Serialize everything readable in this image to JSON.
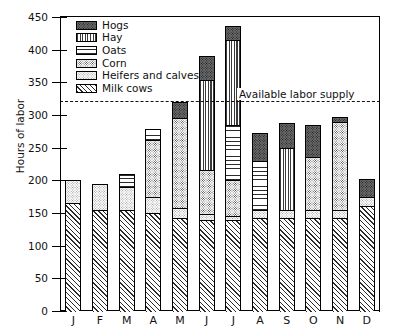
{
  "chart_data": {
    "type": "bar",
    "stacked": true,
    "title": "",
    "xlabel": "",
    "ylabel": "Hours of labor",
    "ylim": [
      0,
      450
    ],
    "ytick_step": 50,
    "yticks": [
      0,
      50,
      100,
      150,
      200,
      250,
      300,
      350,
      400,
      450
    ],
    "grid": false,
    "legend_position": "top-left",
    "categories": [
      "J",
      "F",
      "M",
      "A",
      "M",
      "J",
      "J",
      "A",
      "S",
      "O",
      "N",
      "D"
    ],
    "category_names": [
      "January",
      "February",
      "March",
      "April",
      "May",
      "June",
      "July",
      "August",
      "September",
      "October",
      "November",
      "December"
    ],
    "series": [
      {
        "name": "Milk cows",
        "values": [
          165,
          155,
          155,
          150,
          143,
          140,
          140,
          143,
          143,
          143,
          143,
          160
        ]
      },
      {
        "name": "Heifers and calves",
        "values": [
          35,
          40,
          35,
          25,
          15,
          8,
          5,
          12,
          12,
          12,
          12,
          15
        ]
      },
      {
        "name": "Corn",
        "values": [
          0,
          0,
          0,
          87,
          137,
          68,
          55,
          0,
          0,
          80,
          135,
          0
        ]
      },
      {
        "name": "Oats",
        "values": [
          0,
          0,
          20,
          16,
          0,
          0,
          85,
          75,
          0,
          0,
          0,
          0
        ]
      },
      {
        "name": "Hay",
        "values": [
          0,
          0,
          0,
          0,
          0,
          138,
          130,
          0,
          95,
          0,
          0,
          0
        ]
      },
      {
        "name": "Hogs",
        "values": [
          0,
          0,
          0,
          0,
          25,
          36,
          22,
          43,
          38,
          50,
          7,
          27
        ]
      }
    ],
    "totals": [
      200,
      195,
      210,
      278,
      320,
      390,
      437,
      273,
      288,
      285,
      297,
      202
    ],
    "annotations": [
      {
        "label": "Available labor supply",
        "value": 322,
        "style": "dashed-horizontal-line"
      }
    ],
    "colors": {
      "hogs": "#555555",
      "hay": "#888888",
      "oats": "#ffffff",
      "corn": "#bbbbbb",
      "heifers": "#f0f0f0",
      "milk_cows": "#ffffff",
      "axis": "#000000",
      "background": "#ffffff"
    }
  },
  "legend": {
    "items": [
      {
        "label": "Hogs",
        "key": "hogs"
      },
      {
        "label": "Hay",
        "key": "hay"
      },
      {
        "label": "Oats",
        "key": "oats"
      },
      {
        "label": "Corn",
        "key": "corn"
      },
      {
        "label": "Heifers and calves",
        "key": "heifers"
      },
      {
        "label": "Milk cows",
        "key": "milk"
      }
    ]
  },
  "axis": {
    "y_title": "Hours of labor",
    "y_labels": [
      "450",
      "400",
      "350",
      "300",
      "250",
      "200",
      "150",
      "100",
      "50",
      "0"
    ]
  }
}
